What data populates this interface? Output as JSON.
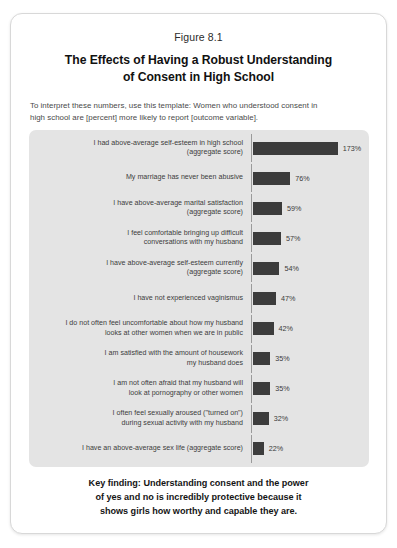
{
  "figure": {
    "number": "Figure 8.1",
    "title_lines": [
      "The Effects of Having a Robust Understanding",
      "of Consent in High School"
    ],
    "intro_lines": [
      "To interpret these numbers, use this template: Women who understood consent in",
      "high school are [percent] more likely to report [outcome variable]."
    ],
    "key_finding_lines": [
      "Key finding: Understanding consent and the power",
      "of yes and no is incredibly protective because it",
      "shows girls how worthy and capable they are."
    ]
  },
  "colors": {
    "bar": "#3c3c3c",
    "panel_background": "#e4e4e4",
    "axis": "#9a9a9a",
    "card_background": "#ffffff"
  },
  "chart_data": {
    "type": "bar",
    "orientation": "horizontal",
    "title": "The Effects of Having a Robust Understanding of Consent in High School",
    "subtitle": "Figure 8.1",
    "xlabel": "",
    "ylabel": "",
    "grid": false,
    "legend": "none",
    "value_suffix": "%",
    "xlim": [
      0,
      173
    ],
    "categories": [
      "I had above-average self-esteem in high school (aggregate score)",
      "My marriage has never been abusive",
      "I have above-average marital satisfaction (aggregate score)",
      "I feel comfortable bringing up difficult conversations with my husband",
      "I have above-average self-esteem currently (aggregate score)",
      "I have not experienced vaginismus",
      "I do not often feel uncomfortable about how my husband looks at other women when we are in public",
      "I am satisfied with the amount of housework my husband does",
      "I am not often afraid that my husband will look at pornography or other women",
      "I often feel sexually aroused (\"turned on\") during sexual activity with my husband",
      "I have an above-average sex life (aggregate score)"
    ],
    "values": [
      173,
      76,
      59,
      57,
      54,
      47,
      42,
      35,
      35,
      32,
      22
    ],
    "value_labels": [
      "173%",
      "76%",
      "59%",
      "57%",
      "54%",
      "47%",
      "42%",
      "35%",
      "35%",
      "32%",
      "22%"
    ],
    "rows": [
      {
        "label_lines": [
          "I had above-average self-esteem in high school",
          "(aggregate score)"
        ],
        "value": 173,
        "value_label": "173%"
      },
      {
        "label_lines": [
          "My marriage has never been abusive"
        ],
        "value": 76,
        "value_label": "76%"
      },
      {
        "label_lines": [
          "I have above-average marital satisfaction",
          "(aggregate score)"
        ],
        "value": 59,
        "value_label": "59%"
      },
      {
        "label_lines": [
          "I feel comfortable bringing up difficult",
          "conversations with my husband"
        ],
        "value": 57,
        "value_label": "57%"
      },
      {
        "label_lines": [
          "I have above-average self-esteem currently",
          "(aggregate score)"
        ],
        "value": 54,
        "value_label": "54%"
      },
      {
        "label_lines": [
          "I have not experienced vaginismus"
        ],
        "value": 47,
        "value_label": "47%"
      },
      {
        "label_lines": [
          "I do not often feel uncomfortable about how my husband",
          "looks at other women when we are in public"
        ],
        "value": 42,
        "value_label": "42%"
      },
      {
        "label_lines": [
          "I am satisfied with the amount of housework",
          "my husband does"
        ],
        "value": 35,
        "value_label": "35%"
      },
      {
        "label_lines": [
          "I am not often afraid that my husband will",
          "look at pornography or other women"
        ],
        "value": 35,
        "value_label": "35%"
      },
      {
        "label_lines": [
          "I often feel sexually aroused (\"turned on\")",
          "during sexual activity with my husband"
        ],
        "value": 32,
        "value_label": "32%"
      },
      {
        "label_lines": [
          "I have an above-average sex life (aggregate score)"
        ],
        "value": 22,
        "value_label": "22%"
      }
    ]
  }
}
